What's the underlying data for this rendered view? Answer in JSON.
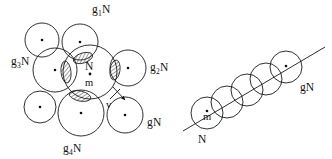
{
  "figure": {
    "background_color": "#ffffff",
    "stroke_color": "#1a1a1a",
    "hatch_color": "#1a1a1a"
  },
  "left_diagram": {
    "name": "coset-cluster-diagram",
    "center_circle": {
      "label_top": "N",
      "label_bottom": "m",
      "cx": 90,
      "cy": 72,
      "r": 27
    },
    "velocity_arrow": {
      "label": "v"
    },
    "coset_circles": [
      {
        "id": "g1N",
        "label_main": "g",
        "label_sub": "1",
        "label_tail": "N",
        "cx": 80,
        "cy": 42,
        "r": 18,
        "label_x": 92,
        "label_y": 13
      },
      {
        "id": "g2N",
        "label_main": "g",
        "label_sub": "2",
        "label_tail": "N",
        "cx": 128,
        "cy": 68,
        "r": 18,
        "label_x": 150,
        "label_y": 71
      },
      {
        "id": "g3N",
        "label_main": "g",
        "label_sub": "3",
        "label_tail": "N",
        "cx": 55,
        "cy": 70,
        "r": 22,
        "label_x": 11,
        "label_y": 65
      },
      {
        "id": "g4N",
        "label_main": "g",
        "label_sub": "4",
        "label_tail": "N",
        "cx": 81,
        "cy": 113,
        "r": 23,
        "label_x": 63,
        "label_y": 152
      },
      {
        "id": "gN",
        "label_main": "g",
        "label_sub": "",
        "label_tail": "N",
        "cx": 125,
        "cy": 115,
        "r": 18,
        "label_x": 147,
        "label_y": 126
      }
    ],
    "free_circles": [
      {
        "id": "free-upper-left",
        "cx": 42,
        "cy": 40,
        "r": 17
      },
      {
        "id": "free-lower-left",
        "cx": 40,
        "cy": 107,
        "r": 16
      }
    ],
    "hatched_overlaps": [
      {
        "id": "overlap-g1N",
        "cx": 83,
        "cy": 58,
        "rx": 10,
        "ry": 5,
        "rot": -18
      },
      {
        "id": "overlap-g2N",
        "cx": 115,
        "cy": 70,
        "rx": 5,
        "ry": 10,
        "rot": 8
      },
      {
        "id": "overlap-g3N",
        "cx": 66,
        "cy": 72,
        "rx": 5,
        "ry": 11,
        "rot": -6
      },
      {
        "id": "overlap-g4N",
        "cx": 80,
        "cy": 96,
        "rx": 11,
        "ry": 5,
        "rot": 12
      }
    ]
  },
  "right_diagram": {
    "name": "coset-chain-diagram",
    "label_first_center": "m",
    "label_first": "N",
    "label_last": "gN",
    "axis": {
      "x1": 183,
      "y1": 131,
      "x2": 325,
      "y2": 47
    },
    "chain_circles": [
      {
        "id": "chain-N",
        "cx": 207,
        "cy": 113,
        "r": 16,
        "dot": true
      },
      {
        "id": "chain-2",
        "cx": 227,
        "cy": 102,
        "r": 16,
        "dot": false
      },
      {
        "id": "chain-3",
        "cx": 247,
        "cy": 90,
        "r": 16,
        "dot": false
      },
      {
        "id": "chain-4",
        "cx": 266,
        "cy": 79,
        "r": 16,
        "dot": false
      },
      {
        "id": "chain-gN",
        "cx": 286,
        "cy": 67,
        "r": 16,
        "dot": true
      }
    ],
    "label_first_x": 198,
    "label_first_y": 143,
    "label_last_x": 300,
    "label_last_y": 91
  }
}
